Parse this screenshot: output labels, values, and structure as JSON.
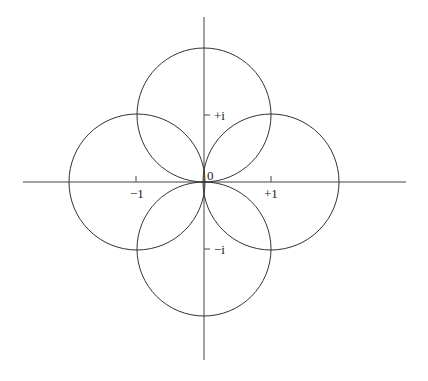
{
  "diagram": {
    "axes": {
      "origin_label": "0",
      "real_ticks": [
        {
          "value": -1,
          "label": "−1"
        },
        {
          "value": 1,
          "label": "+1"
        }
      ],
      "imag_ticks": [
        {
          "value": 1,
          "label": "+i"
        },
        {
          "value": -1,
          "label": "−i"
        }
      ]
    },
    "circles": [
      {
        "name": "top",
        "center": "i",
        "radius": 1
      },
      {
        "name": "bottom",
        "center": "-i",
        "radius": 1
      },
      {
        "name": "left",
        "center": "-1",
        "radius": 1
      },
      {
        "name": "right",
        "center": "+1",
        "radius": 1
      }
    ],
    "colors": {
      "stroke": "#333333",
      "background": "#ffffff"
    }
  }
}
